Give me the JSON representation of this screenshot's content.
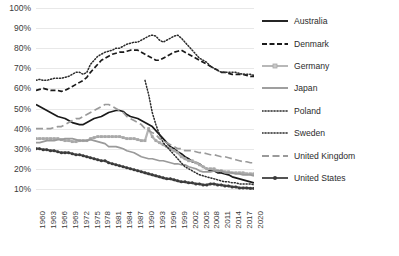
{
  "chart_data": {
    "type": "line",
    "title": "",
    "xlabel": "",
    "ylabel": "",
    "ylim": [
      0,
      100
    ],
    "ytick_labels": [
      "100%",
      "90%",
      "80%",
      "70%",
      "60%",
      "50%",
      "40%",
      "30%",
      "20%",
      "10%"
    ],
    "ytick_values": [
      100,
      90,
      80,
      70,
      60,
      50,
      40,
      30,
      20,
      10
    ],
    "grid": true,
    "legend_position": "right",
    "x_start": 1960,
    "x_end": 2020,
    "xtick_labels": [
      "1960",
      "1963",
      "1966",
      "1969",
      "1972",
      "1975",
      "1978",
      "1981",
      "1984",
      "1987",
      "1990",
      "1993",
      "1996",
      "1999",
      "2002",
      "2005",
      "2008",
      "2011",
      "2014",
      "2017",
      "2020"
    ],
    "x": [
      1960,
      1961,
      1962,
      1963,
      1964,
      1965,
      1966,
      1967,
      1968,
      1969,
      1970,
      1971,
      1972,
      1973,
      1974,
      1975,
      1976,
      1977,
      1978,
      1979,
      1980,
      1981,
      1982,
      1983,
      1984,
      1985,
      1986,
      1987,
      1988,
      1989,
      1990,
      1991,
      1992,
      1993,
      1994,
      1995,
      1996,
      1997,
      1998,
      1999,
      2000,
      2001,
      2002,
      2003,
      2004,
      2005,
      2006,
      2007,
      2008,
      2009,
      2010,
      2011,
      2012,
      2013,
      2014,
      2015,
      2016,
      2017,
      2018,
      2019,
      2020
    ],
    "series": [
      {
        "name": "Australia",
        "color": "#1a1a1a",
        "style": "solid",
        "marker": "none",
        "values": [
          52,
          51,
          50,
          49,
          48,
          47,
          46,
          45.5,
          45,
          44,
          43,
          42.5,
          42,
          42,
          43,
          44,
          45,
          45.5,
          46,
          47,
          48,
          48.5,
          49,
          49,
          48.5,
          47,
          46,
          45.5,
          45,
          44,
          43,
          42,
          41,
          39,
          37,
          35,
          33,
          31,
          30,
          28.5,
          27.5,
          26,
          25,
          23.5,
          23,
          22.5,
          21,
          20,
          19,
          19,
          18,
          18,
          17.5,
          17,
          16,
          15.5,
          15,
          14.5,
          14,
          13.5,
          13
        ]
      },
      {
        "name": "Denmark",
        "color": "#1a1a1a",
        "style": "dashed",
        "marker": "none",
        "values": [
          59,
          59.5,
          60,
          59.5,
          59,
          59,
          59,
          58.5,
          59,
          60,
          61,
          62,
          63,
          64,
          65.5,
          68,
          70,
          72,
          74,
          75,
          76,
          77,
          77.5,
          78,
          78,
          78.5,
          79,
          79,
          79,
          78,
          77,
          76,
          75,
          74,
          74,
          75,
          76,
          77,
          78,
          78.5,
          79,
          78,
          77,
          76,
          75,
          74,
          73,
          72,
          71,
          70,
          69,
          68,
          68,
          67.5,
          67,
          67,
          67,
          67,
          66.5,
          66,
          66
        ]
      },
      {
        "name": "Germany",
        "color": "#b5b5b5",
        "style": "solid",
        "marker": "square",
        "values": [
          35,
          35,
          35,
          35,
          35,
          35,
          35,
          34.5,
          34,
          34,
          33.5,
          33.5,
          34,
          34,
          34,
          35,
          35.5,
          36,
          36,
          36,
          36,
          36,
          36,
          36,
          35.5,
          35,
          35,
          35,
          34.5,
          34,
          34,
          40,
          36,
          34,
          33,
          32,
          31,
          30,
          29,
          28,
          26,
          25,
          24,
          24,
          23,
          22,
          21,
          20,
          20,
          20,
          19,
          19,
          18.5,
          18.5,
          18,
          18,
          18,
          18,
          17.5,
          17.5,
          17.5
        ]
      },
      {
        "name": "Japan",
        "color": "#9a9a9a",
        "style": "solid",
        "marker": "none",
        "values": [
          33,
          33,
          33.5,
          34,
          34,
          34,
          34.5,
          34.5,
          35,
          35,
          35,
          34.5,
          34,
          34,
          34,
          34.5,
          34,
          33.5,
          33,
          32.5,
          31,
          31,
          31,
          30.5,
          30,
          29,
          28.5,
          28,
          27,
          26,
          25.5,
          25,
          25,
          24.5,
          24,
          24,
          23.5,
          23,
          22.5,
          22.5,
          22,
          22,
          21,
          20.5,
          20,
          19,
          18.5,
          18.5,
          18.5,
          19,
          19,
          19,
          18,
          18,
          18,
          17.5,
          17.5,
          17,
          17,
          17,
          16.5
        ]
      },
      {
        "name": "Poland",
        "color": "#2b2b2b",
        "style": "dotted",
        "marker": "none",
        "values": [
          null,
          null,
          null,
          null,
          null,
          null,
          null,
          null,
          null,
          null,
          null,
          null,
          null,
          null,
          null,
          null,
          null,
          null,
          null,
          null,
          null,
          null,
          null,
          null,
          null,
          null,
          null,
          null,
          null,
          null,
          64,
          57,
          48,
          42,
          37,
          33,
          31,
          29,
          27,
          25,
          23,
          21,
          20,
          19,
          18,
          17,
          16.5,
          16,
          15.5,
          15,
          14.5,
          14,
          13.5,
          13.5,
          13,
          13,
          12.5,
          12.5,
          12.5,
          12.5,
          12
        ]
      },
      {
        "name": "Sweden",
        "color": "#2b2b2b",
        "style": "dotted",
        "marker": "none",
        "values": [
          64,
          64.5,
          64,
          64,
          64.5,
          65,
          65,
          65,
          65.5,
          66,
          67,
          68,
          68,
          67,
          68,
          72,
          74,
          76,
          77,
          78,
          78.5,
          79,
          80,
          80,
          81,
          82,
          82.5,
          83,
          83,
          84,
          85,
          86,
          86.5,
          86,
          84,
          83,
          84,
          85,
          86,
          86.5,
          85,
          83,
          81,
          79,
          77,
          75,
          74,
          73,
          71,
          70,
          69,
          68,
          68,
          68,
          68,
          68,
          67.5,
          67,
          67,
          67,
          66.5
        ]
      },
      {
        "name": "United Kingdom",
        "color": "#9a9a9a",
        "style": "longdash",
        "marker": "none",
        "values": [
          40,
          40,
          40,
          40,
          40,
          40.5,
          41,
          41,
          42,
          43,
          44,
          45,
          45,
          46,
          47,
          48,
          49,
          50,
          51,
          52,
          52,
          51,
          50,
          49,
          48,
          46,
          45,
          44,
          43,
          42,
          40,
          39,
          38,
          37,
          35,
          34,
          33,
          32,
          31,
          30,
          30,
          29,
          29,
          29,
          28.5,
          28,
          28,
          27.5,
          27,
          27,
          26.5,
          26,
          26,
          25.5,
          25,
          24.5,
          24,
          23.5,
          23.5,
          23,
          23
        ]
      },
      {
        "name": "United States",
        "color": "#4a4a4a",
        "style": "solid",
        "marker": "circle",
        "values": [
          30,
          30,
          29.5,
          29.5,
          29,
          29,
          28.5,
          28,
          28,
          28,
          27.5,
          27,
          27,
          26.5,
          26,
          25.5,
          25,
          24.5,
          24,
          24,
          23,
          22.5,
          22,
          21.5,
          21,
          20.5,
          20,
          19.5,
          19,
          18.5,
          18,
          17.5,
          17,
          16.5,
          16,
          15.5,
          15,
          15,
          14.5,
          14,
          13.5,
          13.5,
          13,
          13,
          12.5,
          12.5,
          12,
          12,
          12.5,
          12.5,
          12,
          12,
          11.5,
          11.5,
          11,
          11,
          10.5,
          10.5,
          10.5,
          10.3,
          10.3
        ]
      }
    ]
  },
  "legend": {
    "items": [
      {
        "label": "Australia"
      },
      {
        "label": "Denmark"
      },
      {
        "label": "Germany"
      },
      {
        "label": "Japan"
      },
      {
        "label": "Poland"
      },
      {
        "label": "Sweden"
      },
      {
        "label": "United Kingdom"
      },
      {
        "label": "United States"
      }
    ]
  }
}
